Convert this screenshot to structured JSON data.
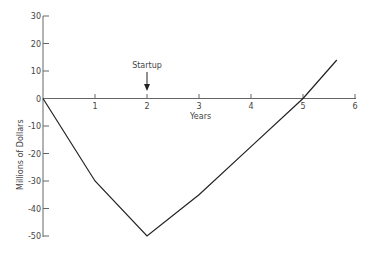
{
  "chart_data": {
    "type": "line",
    "title": "",
    "xlabel": "Years",
    "ylabel": "Millions of Dollars",
    "x_ticks": [
      1,
      2,
      3,
      4,
      5,
      6
    ],
    "y_ticks": [
      30,
      20,
      10,
      0,
      -10,
      -20,
      -30,
      -40,
      -50
    ],
    "xlim": [
      0,
      6
    ],
    "ylim": [
      -50,
      30
    ],
    "grid": false,
    "legend": null,
    "series": [
      {
        "name": "Cumulative cash flow",
        "x": [
          0,
          1,
          2,
          3,
          4,
          5,
          5.65
        ],
        "values": [
          0,
          -30,
          -50,
          -35,
          -17.5,
          0,
          14
        ]
      }
    ],
    "annotations": [
      {
        "text": "Startup",
        "x": 2,
        "arrow": "down"
      }
    ]
  }
}
